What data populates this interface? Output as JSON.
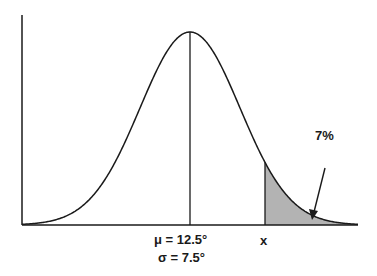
{
  "chart_data": {
    "type": "area",
    "title": "",
    "distribution": "normal",
    "mean": 12.5,
    "sd": 7.5,
    "shaded_region": "upper tail beyond x",
    "shaded_percent": 7,
    "xlabel": "",
    "ylabel": "",
    "grid": false,
    "annotations": [
      "μ = 12.5°",
      "σ = 7.5°",
      "x",
      "7%"
    ]
  },
  "labels": {
    "mu": "μ = 12.5°",
    "sigma": "σ = 7.5°",
    "x": "x",
    "percent": "7%"
  },
  "colors": {
    "line": "#1a1a1a",
    "shade": "#b3b3b3"
  }
}
